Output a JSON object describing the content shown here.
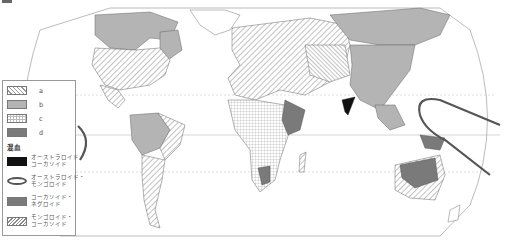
{
  "map": {
    "title_marker": "■",
    "colors": {
      "land_hatch": "#888888",
      "b_fill": "#b4b4b4",
      "d_fill": "#7a7a7a",
      "black": "#111111",
      "ocean": "#ffffff",
      "border": "#999999",
      "curve": "#555555"
    }
  },
  "legend": {
    "items": [
      {
        "key": "a",
        "label": "a",
        "pattern": "diagonal-hatch"
      },
      {
        "key": "b",
        "label": "b",
        "pattern": "light-gray-fill"
      },
      {
        "key": "c",
        "label": "c",
        "pattern": "grid-hatch"
      },
      {
        "key": "d",
        "label": "d",
        "pattern": "dark-gray-fill"
      }
    ],
    "mixed_header": "混血",
    "mixed_items": [
      {
        "line1": "オーストラロイド・",
        "line2": "コーカソイド",
        "pattern": "black-fill"
      },
      {
        "line1": "オーストラロイド・",
        "line2": "モンゴロイド",
        "pattern": "thick-outline-curve"
      },
      {
        "line1": "コーカソイド・",
        "line2": "ネグロイド",
        "pattern": "medium-gray-fill"
      },
      {
        "line1": "モンゴロイド・",
        "line2": "コーカソイド",
        "pattern": "dense-diagonal-hatch"
      }
    ]
  }
}
